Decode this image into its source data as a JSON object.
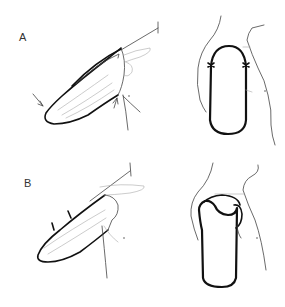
{
  "figure": {
    "panels": [
      {
        "label": "A",
        "views": [
          "lateral-arm-flap-outline",
          "anterior-flap-outline-with-markers"
        ]
      },
      {
        "label": "B",
        "views": [
          "lateral-arm-flap-segmented",
          "anterior-flap-elevated"
        ]
      }
    ],
    "colors": {
      "ink": "#111111",
      "sketch": "#444444",
      "background": "#ffffff"
    }
  }
}
